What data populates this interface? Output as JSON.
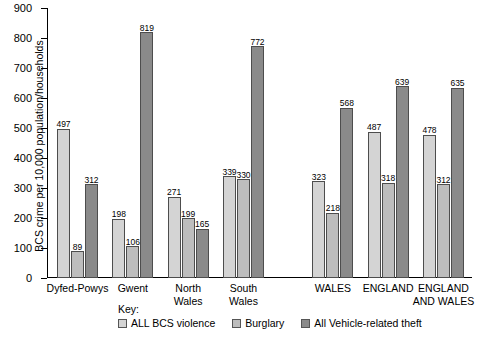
{
  "chart_data": {
    "type": "bar",
    "title": "",
    "subtitle": "",
    "xlabel": "",
    "ylabel": "BCS crime per 10,000 population/households",
    "ylim": [
      0,
      900
    ],
    "ytick_step": 100,
    "yticks": [
      0,
      100,
      200,
      300,
      400,
      500,
      600,
      700,
      800,
      900
    ],
    "grid": false,
    "legend_position": "bottom",
    "legend_title": "Key:",
    "categories": [
      "Dyfed-Powys",
      "Gwent",
      "North\nWales",
      "South\nWales",
      "WALES",
      "ENGLAND",
      "ENGLAND\nAND WALES"
    ],
    "series": [
      {
        "name": "ALL BCS violence",
        "color": "#d4d4d4",
        "values": [
          497,
          198,
          271,
          339,
          323,
          487,
          478
        ]
      },
      {
        "name": "Burglary",
        "color": "#bdbdbd",
        "values": [
          89,
          106,
          199,
          330,
          218,
          318,
          312
        ]
      },
      {
        "name": "All Vehicle-related theft",
        "color": "#8a8a8a",
        "values": [
          312,
          819,
          165,
          772,
          568,
          639,
          635
        ]
      }
    ],
    "group_separator_after_index": 3
  }
}
